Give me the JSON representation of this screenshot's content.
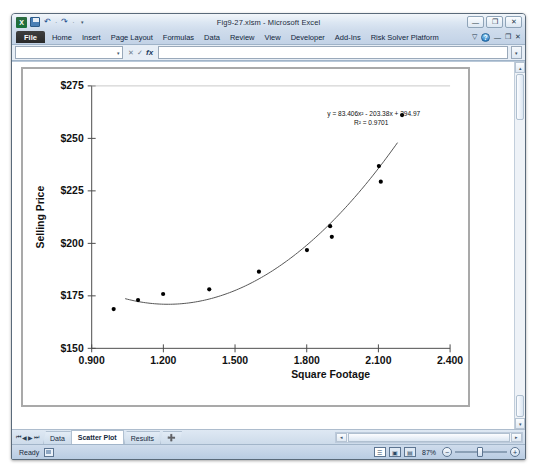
{
  "window": {
    "title": "Fig9-27.xlsm - Microsoft Excel",
    "minimize_label": "—",
    "restore_label": "❐",
    "close_label": "✕",
    "app_logo_label": "X"
  },
  "quick_access": {
    "save_name": "save-icon",
    "undo_label": "↶",
    "redo_label": "↷",
    "dropdown_label": "▾",
    "separator_label": "·"
  },
  "ribbon": {
    "tabs": [
      {
        "label": "File"
      },
      {
        "label": "Home"
      },
      {
        "label": "Insert"
      },
      {
        "label": "Page Layout"
      },
      {
        "label": "Formulas"
      },
      {
        "label": "Data"
      },
      {
        "label": "Review"
      },
      {
        "label": "View"
      },
      {
        "label": "Developer"
      },
      {
        "label": "Add-Ins"
      },
      {
        "label": "Risk Solver Platform"
      }
    ],
    "collapse_label": "▽",
    "help_label": "?",
    "min_ribbon_label": "—",
    "restore_ribbon_label": "❐",
    "close_ribbon_label": "✕"
  },
  "formula_bar": {
    "name_box_value": "",
    "name_box_caret": "▾",
    "cancel_label": "✕",
    "enter_label": "✓",
    "fx_label": "fx",
    "formula_value": "",
    "expand_label": "▾"
  },
  "scrollbars": {
    "up_label": "▴",
    "down_label": "▾",
    "left_label": "◂",
    "right_label": "▸"
  },
  "sheet_tabs": {
    "nav_first": "⏮",
    "nav_prev": "◀",
    "nav_next": "▶",
    "nav_last": "⏭",
    "items": [
      {
        "label": "Data",
        "active": false
      },
      {
        "label": "Scatter Plot",
        "active": true
      },
      {
        "label": "Results",
        "active": false
      }
    ],
    "add_sheet_label": "➕"
  },
  "status_bar": {
    "state": "Ready",
    "macro_icon": "record-macro-icon",
    "view_normal": "☰",
    "view_layout": "▣",
    "view_break": "▤",
    "zoom_level": "87%",
    "zoom_out_label": "−",
    "zoom_in_label": "+"
  },
  "chart_data": {
    "type": "scatter",
    "title": "",
    "xlabel": "Square Footage",
    "ylabel": "Selling Price",
    "xlim": [
      0.9,
      2.4
    ],
    "ylim": [
      150,
      275
    ],
    "xticks": [
      "0.900",
      "1.200",
      "1.500",
      "1.800",
      "2.100",
      "2.400"
    ],
    "xtick_values": [
      0.9,
      1.2,
      1.5,
      1.8,
      2.1,
      2.4
    ],
    "yticks": [
      "$150",
      "$175",
      "$200",
      "$225",
      "$250",
      "$275"
    ],
    "ytick_values": [
      150,
      175,
      200,
      225,
      250,
      275
    ],
    "grid": false,
    "legend": "none",
    "marker_color": "#000000",
    "trendline_color": "#555555",
    "plot_border_color": "#a9a9a9",
    "points": [
      {
        "x": 0.992,
        "y": 168.7
      },
      {
        "x": 1.094,
        "y": 173.0
      },
      {
        "x": 1.199,
        "y": 175.9
      },
      {
        "x": 1.392,
        "y": 178.1
      },
      {
        "x": 1.6,
        "y": 186.5
      },
      {
        "x": 1.801,
        "y": 196.8
      },
      {
        "x": 1.898,
        "y": 208.2
      },
      {
        "x": 1.905,
        "y": 203.1
      },
      {
        "x": 2.102,
        "y": 236.8
      },
      {
        "x": 2.11,
        "y": 229.4
      },
      {
        "x": 2.199,
        "y": 261.1
      }
    ],
    "trendline": {
      "type": "polynomial",
      "order": 2,
      "a": 83.406,
      "b": -203.38,
      "c": 294.97,
      "x_start": 1.04,
      "x_end": 2.18,
      "equation": "y = 83.406x² - 203.38x + 294.97",
      "r_squared": "R² = 0.9701"
    }
  }
}
